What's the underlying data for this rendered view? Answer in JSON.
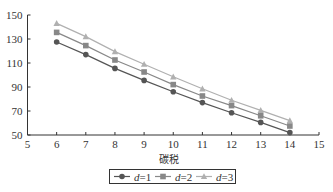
{
  "chart_data": {
    "type": "line",
    "title": "",
    "xlabel": "碳税",
    "ylabel": "",
    "xlim": [
      5,
      15
    ],
    "ylim": [
      50,
      150
    ],
    "xticks": [
      5,
      6,
      7,
      8,
      9,
      10,
      11,
      12,
      13,
      14,
      15
    ],
    "yticks": [
      50,
      70,
      90,
      110,
      130,
      150
    ],
    "grid": false,
    "legend_position": "bottom",
    "x": [
      6,
      7,
      8,
      9,
      10,
      11,
      12,
      13,
      14
    ],
    "series": [
      {
        "name": "d=1",
        "var": "d",
        "eq": "=1",
        "marker": "circle",
        "color": "#555555",
        "values": [
          127.5,
          117,
          105.5,
          95.5,
          86,
          77,
          68.5,
          60.5,
          52
        ]
      },
      {
        "name": "d=2",
        "var": "d",
        "eq": "=2",
        "marker": "square",
        "color": "#888888",
        "values": [
          135.5,
          124.5,
          112.5,
          102.5,
          92,
          82.5,
          74.5,
          66,
          57.5
        ]
      },
      {
        "name": "d=3",
        "var": "d",
        "eq": "=3",
        "marker": "triangle",
        "color": "#b0b0b0",
        "values": [
          143,
          132,
          119.5,
          109,
          98.5,
          88.5,
          79,
          70.5,
          62
        ]
      }
    ]
  }
}
